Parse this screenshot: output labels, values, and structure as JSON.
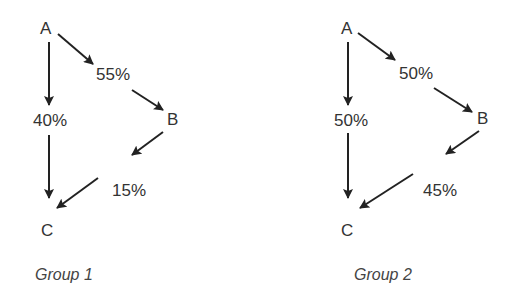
{
  "groups": [
    {
      "caption": "Group 1",
      "nodes": {
        "a": "A",
        "b": "B",
        "c": "C"
      },
      "edges": {
        "a_to_b": "55%",
        "a_to_c": "40%",
        "b_to_c": "15%"
      }
    },
    {
      "caption": "Group 2",
      "nodes": {
        "a": "A",
        "b": "B",
        "c": "C"
      },
      "edges": {
        "a_to_b": "50%",
        "a_to_c": "50%",
        "b_to_c": "45%"
      }
    }
  ],
  "colors": {
    "arrow": "#222222",
    "text": "#333333",
    "background": "#ffffff"
  }
}
